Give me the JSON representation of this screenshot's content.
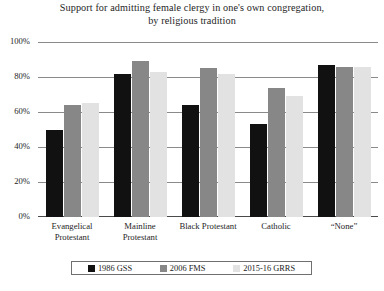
{
  "chart_data": {
    "type": "bar",
    "title": "Support for admitting female clergy in one's own congregation, by religious tradition",
    "title_line1": "Support for admitting female clergy in one's own congregation,",
    "title_line2": "by religious tradition",
    "xlabel": "",
    "ylabel": "",
    "ylim": [
      0,
      100
    ],
    "grid": true,
    "legend_position": "bottom",
    "ytick_labels": [
      "100%",
      "80%",
      "60%",
      "40%",
      "20%",
      "0%"
    ],
    "ytick_values": [
      100,
      80,
      60,
      40,
      20,
      0
    ],
    "categories": [
      "Evangelical Protestant",
      "Mainline Protestant",
      "Black Protestant",
      "Catholic",
      "“None”"
    ],
    "category_lines": [
      [
        "Evangelical",
        "Protestant"
      ],
      [
        "Mainline",
        "Protestant"
      ],
      [
        "Black Protestant"
      ],
      [
        "Catholic"
      ],
      [
        "“None”"
      ]
    ],
    "series": [
      {
        "name": "1986 GSS",
        "color": "#111111",
        "values": [
          50,
          82,
          64,
          53,
          87
        ]
      },
      {
        "name": "2006 FMS",
        "color": "#878787",
        "values": [
          64,
          89,
          85,
          74,
          86
        ]
      },
      {
        "name": "2015-16 GRRS",
        "color": "#e2e2e2",
        "values": [
          65,
          83,
          82,
          69,
          86
        ]
      }
    ]
  },
  "legend": {
    "items": [
      {
        "label": "1986 GSS"
      },
      {
        "label": "2006 FMS"
      },
      {
        "label": "2015-16 GRRS"
      }
    ]
  }
}
